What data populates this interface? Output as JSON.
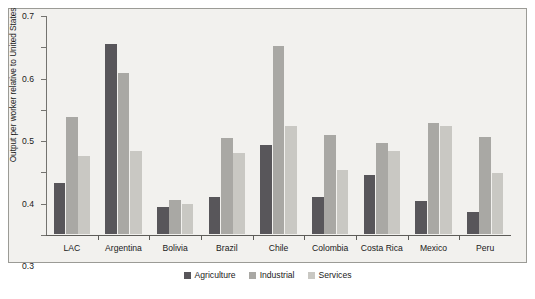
{
  "chart_data": {
    "type": "bar",
    "title": "",
    "xlabel": "",
    "ylabel": "Output per worker relative to United States",
    "ylim": [
      0,
      0.7
    ],
    "yticks": [
      "0",
      "0.1",
      "0.2",
      "0.3",
      "0.4",
      "0.5",
      "0.6",
      "0.7"
    ],
    "grid": false,
    "legend_position": "bottom-center",
    "categories": [
      "LAC",
      "Argentina",
      "Bolivia",
      "Brazil",
      "Chile",
      "Colombia",
      "Costa Rica",
      "Mexico",
      "Peru"
    ],
    "series": [
      {
        "name": "Agriculture",
        "color": "#58565a",
        "values": [
          0.163,
          0.608,
          0.085,
          0.119,
          0.286,
          0.119,
          0.189,
          0.105,
          0.071
        ]
      },
      {
        "name": "Industrial",
        "color": "#a9a8a4",
        "values": [
          0.374,
          0.515,
          0.11,
          0.308,
          0.6,
          0.318,
          0.29,
          0.354,
          0.31
        ]
      },
      {
        "name": "Services",
        "color": "#c9c8c3",
        "values": [
          0.248,
          0.265,
          0.095,
          0.258,
          0.344,
          0.205,
          0.265,
          0.345,
          0.196
        ]
      }
    ]
  },
  "legend": {
    "items": [
      {
        "label": "Agriculture",
        "swatch": "agriculture-swatch"
      },
      {
        "label": "Industrial",
        "swatch": "industrial-swatch"
      },
      {
        "label": "Services",
        "swatch": "services-swatch"
      }
    ]
  }
}
